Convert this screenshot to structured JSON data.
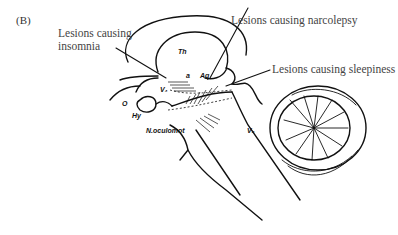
{
  "figure": {
    "panel_label": "(B)",
    "callouts": {
      "insomnia_line1": "Lesions causing",
      "insomnia_line2": "insomnia",
      "narcolepsy": "Lesions causing narcolepsy",
      "sleepiness": "Lesions causing sleepiness"
    },
    "anatomy_labels": {
      "thalamus": "Th",
      "a": "a",
      "aq": "Aq",
      "o": "O",
      "hy": "Hy",
      "v3": "V₃",
      "v4": "V₄",
      "nucleus": "N.oculomot"
    }
  }
}
